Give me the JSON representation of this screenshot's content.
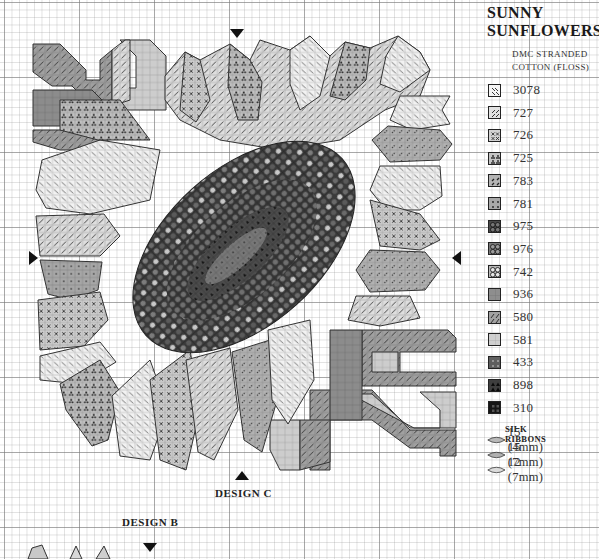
{
  "legend": {
    "title_line1": "SUNNY",
    "title_line2": "SUNFLOWERS",
    "subtitle_line1": "DMC STRANDED",
    "subtitle_line2": "COTTON (FLOSS)",
    "threads": [
      {
        "code": "3078",
        "symbol": "diagonal-dashes-light",
        "fill": "#f4f4f4"
      },
      {
        "code": "727",
        "symbol": "diagonal-dashes",
        "fill": "#e2e2e2"
      },
      {
        "code": "726",
        "symbol": "cross-x",
        "fill": "#d2d2d2"
      },
      {
        "code": "725",
        "symbol": "clover-triangles",
        "fill": "#c4c4c4"
      },
      {
        "code": "783",
        "symbol": "dots-diagonal-pairs",
        "fill": "#b4b4b4"
      },
      {
        "code": "781",
        "symbol": "four-dots",
        "fill": "#a8a8a8"
      },
      {
        "code": "975",
        "symbol": "four-circles-dark",
        "fill": "#4a4a4a"
      },
      {
        "code": "976",
        "symbol": "four-circles-mid",
        "fill": "#7a7a7a"
      },
      {
        "code": "742",
        "symbol": "four-circles-light",
        "fill": "#b8b8b8"
      },
      {
        "code": "936",
        "symbol": "solid-mid",
        "fill": "#8e8e8e"
      },
      {
        "code": "580",
        "symbol": "slashes",
        "fill": "#a2a2a2"
      },
      {
        "code": "581",
        "symbol": "solid-light",
        "fill": "#cfcfcf"
      },
      {
        "code": "433",
        "symbol": "dark-dotted",
        "fill": "#5e5e5e"
      },
      {
        "code": "898",
        "symbol": "dark-triangles",
        "fill": "#3e3e3e"
      },
      {
        "code": "310",
        "symbol": "black-squares",
        "fill": "#151515"
      }
    ],
    "ribbons_title": "SILK RIBBONS",
    "ribbons": [
      {
        "label": "15 (4mm)",
        "fill": "#b9b9b9"
      },
      {
        "label": "15 (7mm)",
        "fill": "#b0b0b0"
      },
      {
        "label": "12 (7mm)",
        "fill": "#dcdcdc"
      }
    ]
  },
  "labels": {
    "design_c": "DESIGN C",
    "design_b": "DESIGN B"
  },
  "center_markers": {
    "top": {
      "x": 237,
      "y": 29
    },
    "bottom": {
      "x": 242,
      "y": 471
    },
    "left": {
      "x": 29,
      "y": 258
    },
    "right": {
      "x": 456,
      "y": 258
    },
    "design_b_top": {
      "x": 150,
      "y": 545
    }
  },
  "stitch_chart": {
    "note": "Approximate reconstruction of the shapes and tones, not a cell-by-cell transcription of the chart.",
    "grid_cell_px": 7.5,
    "bold_grid_every": 10,
    "pattern_bounds": {
      "left": 33,
      "top": 36,
      "right": 456,
      "bottom": 470
    },
    "center_head": {
      "shape": "rotated-ellipse",
      "cx": 244,
      "cy": 247,
      "rx": 130,
      "ry": 75,
      "rotate_deg": -42,
      "colors": [
        "975",
        "976",
        "742",
        "898",
        "310",
        "433"
      ]
    },
    "petal_colors": [
      "3078",
      "727",
      "726",
      "725",
      "783",
      "781"
    ],
    "leaf_colors": [
      "936",
      "580",
      "581"
    ]
  }
}
